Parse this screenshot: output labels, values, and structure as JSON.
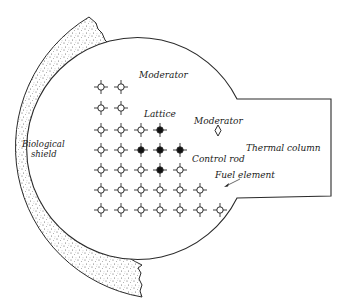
{
  "diagram": {
    "type": "reactor-cross-section",
    "labels": {
      "moderator_top": "Moderator",
      "moderator_right": "Moderator",
      "lattice": "Lattice",
      "biological_shield_line1": "Biological",
      "biological_shield_line2": "shield",
      "thermal_column": "Thermal column",
      "control_rod": "Control rod",
      "fuel_element": "Fuel element"
    },
    "lattice": {
      "row_y": [
        87,
        108,
        130,
        150,
        170,
        190,
        210
      ],
      "col_x": [
        101,
        121,
        141,
        160,
        180,
        200,
        220
      ],
      "rows": [
        [
          "o",
          "o"
        ],
        [
          "o",
          "o"
        ],
        [
          "o",
          "o",
          "o",
          "x"
        ],
        [
          "o",
          "o",
          "x",
          "x",
          "x"
        ],
        [
          "o",
          "o",
          "o",
          "x",
          "o"
        ],
        [
          "o",
          "o",
          "o",
          "o",
          "o",
          "o"
        ],
        [
          "o",
          "o",
          "o",
          "o",
          "o",
          "o",
          "o"
        ]
      ],
      "legend": {
        "o": "fuel element (hollow)",
        "x": "control rod (filled)"
      }
    },
    "colors": {
      "line": "#2a2a2a",
      "shield_dots": "#555555",
      "background": "#ffffff"
    }
  }
}
